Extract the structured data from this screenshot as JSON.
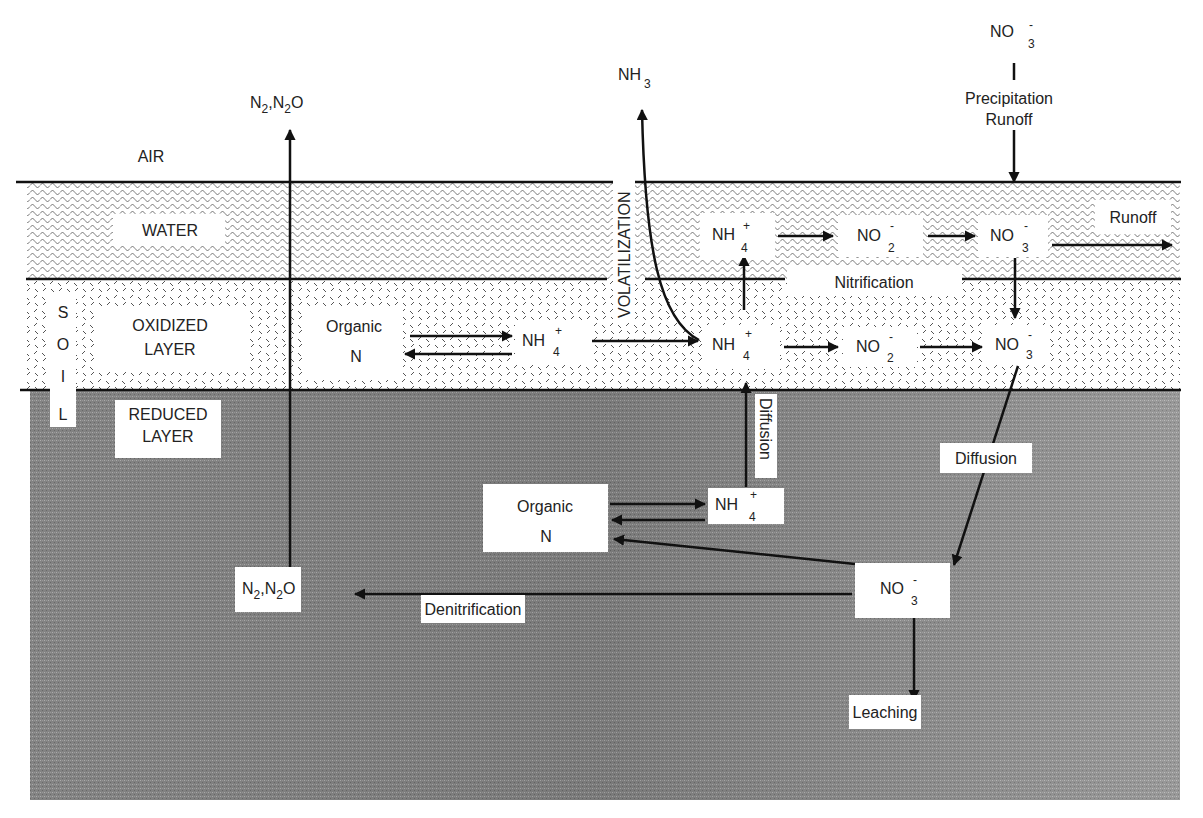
{
  "colors": {
    "background": "#ffffff",
    "water_bg": "#d8d8d8",
    "oxidized_bg": "#eeeeee",
    "reduced_bg": "#8d8d8d",
    "line": "#111111",
    "label_box": "#ffffff",
    "text": "#222222"
  },
  "zones": {
    "air": "AIR",
    "water": "WATER",
    "oxidized": [
      "OXIDIZED",
      "LAYER"
    ],
    "reduced": [
      "REDUCED",
      "LAYER"
    ],
    "soil_letters": [
      "S",
      "O",
      "I",
      "L"
    ]
  },
  "species": {
    "n2_n2o_air": {
      "parts": [
        "N",
        "2",
        ",N",
        "2",
        "O"
      ]
    },
    "nh3_air": {
      "main": "NH",
      "sub": "3"
    },
    "no3_air": {
      "main": "NO",
      "sub": "3",
      "sup": "-"
    },
    "water_nh4": {
      "main": "NH",
      "sub": "4",
      "sup": "+"
    },
    "water_no2": {
      "main": "NO",
      "sub": "2",
      "sup": "-"
    },
    "water_no3": {
      "main": "NO",
      "sub": "3",
      "sup": "-"
    },
    "ox_organic": [
      "Organic",
      "N"
    ],
    "ox_nh4_left": {
      "main": "NH",
      "sub": "4",
      "sup": "+"
    },
    "ox_nh4": {
      "main": "NH",
      "sub": "4",
      "sup": "+"
    },
    "ox_no2": {
      "main": "NO",
      "sub": "2",
      "sup": "-"
    },
    "ox_no3": {
      "main": "NO",
      "sub": "3",
      "sup": "-"
    },
    "red_organic": [
      "Organic",
      "N"
    ],
    "red_nh4": {
      "main": "NH",
      "sub": "4",
      "sup": "+"
    },
    "red_no3": {
      "main": "NO",
      "sub": "3",
      "sup": "-"
    },
    "red_n2_n2o": {
      "parts": [
        "N",
        "2",
        ",N",
        "2",
        "O"
      ]
    }
  },
  "processes": {
    "precipitation": [
      "Precipitation",
      "Runoff"
    ],
    "runoff": "Runoff",
    "nitrification": "Nitrification",
    "volatilization": "VOLATILIZATION",
    "diffusion_vertical": "Diffusion",
    "diffusion_diagonal": "Diffusion",
    "denitrification": "Denitrification",
    "leaching": "Leaching"
  }
}
